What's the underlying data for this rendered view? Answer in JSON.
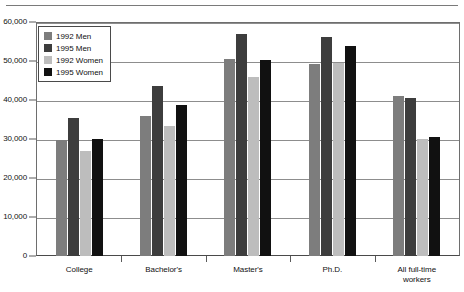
{
  "chart_data": {
    "type": "bar",
    "title": "",
    "xlabel": "",
    "ylabel": "",
    "grid": true,
    "legend_position": "top-left-inside",
    "categories": [
      "College",
      "Bachelor's",
      "Master's",
      "Ph.D.",
      "All full-time\nworkers"
    ],
    "ylim": [
      0,
      60000
    ],
    "yticks": [
      0,
      10000,
      20000,
      30000,
      40000,
      50000,
      60000
    ],
    "ytick_labels": [
      "0",
      "10,000",
      "20,000",
      "30,000",
      "40,000",
      "50,000",
      "60,000"
    ],
    "series": [
      {
        "name": "1992 Men",
        "color": "#7d7d7d",
        "values": [
          29800,
          35900,
          50500,
          49200,
          41000
        ]
      },
      {
        "name": "1995 Men",
        "color": "#3d3d3d",
        "values": [
          35400,
          43500,
          57000,
          56200,
          40500
        ]
      },
      {
        "name": "1992 Women",
        "color": "#bdbdbd",
        "values": [
          26900,
          33400,
          46000,
          49500,
          30100
        ]
      },
      {
        "name": "1995 Women",
        "color": "#111111",
        "values": [
          29900,
          38700,
          50200,
          53800,
          30400
        ]
      }
    ]
  },
  "legend": {
    "items": [
      {
        "label": "1992 Men",
        "swatch": "#7d7d7d"
      },
      {
        "label": "1995 Men",
        "swatch": "#3d3d3d"
      },
      {
        "label": "1992 Women",
        "swatch": "#bdbdbd"
      },
      {
        "label": "1995 Women",
        "swatch": "#111111"
      }
    ]
  }
}
